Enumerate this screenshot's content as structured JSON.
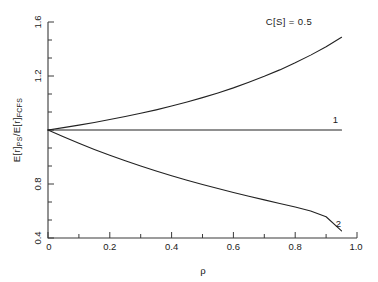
{
  "chart_data": {
    "type": "line",
    "title": "",
    "xlabel": "ρ",
    "ylabel": "E[r]PS/E[r]FCFS",
    "ylabel_parts": {
      "base1": "E[r]",
      "sub1": "PS",
      "slash": "/",
      "base2": "E[r]",
      "sub2": "FCFS"
    },
    "xlim": [
      0,
      1.0
    ],
    "ylim": [
      0.4,
      1.6
    ],
    "xticks": [
      0,
      0.2,
      0.4,
      0.6,
      0.8,
      1.0
    ],
    "xticklabels": [
      "0",
      "0.2",
      "0.4",
      "0.6",
      "0.8",
      "1.0"
    ],
    "xminor_step": 0.1,
    "yticks": [
      0.4,
      0.8,
      1.2,
      1.6
    ],
    "yticklabels": [
      "0.4",
      "0.8",
      "1.2",
      "1.6"
    ],
    "yminor_step": 0.1,
    "grid": false,
    "legend_position": "inline-annotations",
    "annotations": [
      {
        "name": "cs-half-label",
        "text": "C[S] = 0.5",
        "x": 0.78,
        "y": 1.585
      },
      {
        "name": "curve-1-label",
        "text": "1",
        "x": 0.93,
        "y": 1.04
      },
      {
        "name": "curve-2-label",
        "text": "2",
        "x": 0.94,
        "y": 0.46
      }
    ],
    "series": [
      {
        "name": "C[S] = 0.5",
        "label": "C[S] = 0.5",
        "color": "#222222",
        "x": [
          0.0,
          0.05,
          0.1,
          0.15,
          0.2,
          0.25,
          0.3,
          0.35,
          0.4,
          0.45,
          0.5,
          0.55,
          0.6,
          0.65,
          0.7,
          0.75,
          0.8,
          0.85,
          0.9,
          0.95
        ],
        "values": [
          1.0,
          1.013,
          1.027,
          1.042,
          1.058,
          1.075,
          1.093,
          1.112,
          1.133,
          1.156,
          1.18,
          1.206,
          1.234,
          1.265,
          1.298,
          1.334,
          1.373,
          1.416,
          1.463,
          1.515
        ]
      },
      {
        "name": "C[S] = 1",
        "label": "1",
        "color": "#222222",
        "x": [
          0.0,
          0.1,
          0.2,
          0.3,
          0.4,
          0.5,
          0.6,
          0.7,
          0.8,
          0.9,
          0.95
        ],
        "values": [
          1.0,
          1.0,
          1.0,
          1.0,
          1.0,
          1.0,
          1.0,
          1.0,
          1.0,
          1.0,
          1.0
        ]
      },
      {
        "name": "C[S] = 2",
        "label": "2",
        "color": "#222222",
        "x": [
          0.0,
          0.05,
          0.1,
          0.15,
          0.2,
          0.25,
          0.3,
          0.35,
          0.4,
          0.45,
          0.5,
          0.55,
          0.6,
          0.65,
          0.7,
          0.75,
          0.8,
          0.85,
          0.9,
          0.95
        ],
        "values": [
          1.0,
          0.962,
          0.926,
          0.892,
          0.86,
          0.829,
          0.8,
          0.772,
          0.746,
          0.721,
          0.697,
          0.675,
          0.653,
          0.632,
          0.612,
          0.592,
          0.572,
          0.55,
          0.518,
          0.44
        ]
      }
    ]
  }
}
